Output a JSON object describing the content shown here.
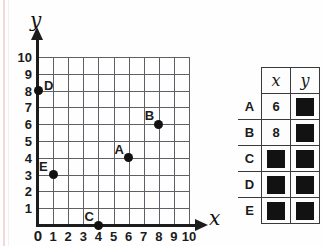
{
  "chart_data": {
    "type": "scatter",
    "title": "",
    "xlabel": "x",
    "ylabel": "y",
    "xlim": [
      0,
      10
    ],
    "ylim": [
      0,
      10
    ],
    "xticks": [
      0,
      1,
      2,
      3,
      4,
      5,
      6,
      7,
      8,
      9,
      10
    ],
    "yticks": [
      0,
      1,
      2,
      3,
      4,
      5,
      6,
      7,
      8,
      9,
      10
    ],
    "grid": true,
    "legend": "none",
    "points": [
      {
        "label": "A",
        "x": 6,
        "y": 4,
        "label_pos": "upper-left"
      },
      {
        "label": "B",
        "x": 8,
        "y": 6,
        "label_pos": "upper-left"
      },
      {
        "label": "C",
        "x": 4,
        "y": 0,
        "label_pos": "upper-left"
      },
      {
        "label": "D",
        "x": 0,
        "y": 8,
        "label_pos": "upper-right"
      },
      {
        "label": "E",
        "x": 1,
        "y": 3,
        "label_pos": "upper-left"
      }
    ]
  },
  "graph": {
    "y_axis_label": "y",
    "x_axis_label": "x",
    "y_tick_labels": [
      "10",
      "9",
      "8",
      "7",
      "6",
      "5",
      "4",
      "3",
      "2",
      "1"
    ],
    "x_tick_labels": [
      "0",
      "1",
      "2",
      "3",
      "4",
      "5",
      "6",
      "7",
      "8",
      "9",
      "10"
    ],
    "origin_label": "0"
  },
  "table": {
    "columns": [
      "",
      "x",
      "y"
    ],
    "header": {
      "x": "x",
      "y": "y"
    },
    "rows": [
      {
        "name": "A",
        "x": "6",
        "y": "",
        "x_hidden": false,
        "y_hidden": true
      },
      {
        "name": "B",
        "x": "8",
        "y": "",
        "x_hidden": false,
        "y_hidden": true
      },
      {
        "name": "C",
        "x": "",
        "y": "",
        "x_hidden": true,
        "y_hidden": true
      },
      {
        "name": "D",
        "x": "",
        "y": "",
        "x_hidden": true,
        "y_hidden": true
      },
      {
        "name": "E",
        "x": "",
        "y": "",
        "x_hidden": true,
        "y_hidden": true
      }
    ]
  },
  "colors": {
    "ink": "#1b1b1b",
    "grid": "#5d6166",
    "point": "#111111",
    "redacted": "#121212"
  }
}
